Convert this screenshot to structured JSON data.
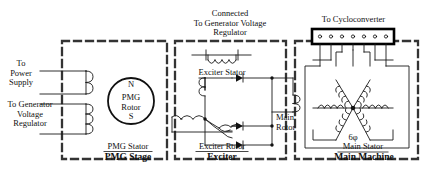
{
  "diagram": {
    "stages": [
      {
        "id": "pmg",
        "caption": "PMG Stage",
        "inner_label": "PMG Stator"
      },
      {
        "id": "exciter",
        "caption": "Exciter",
        "inner_label": "Exciter Rotor"
      },
      {
        "id": "main",
        "caption": "Main Machine",
        "inner_label": "Main Stator"
      }
    ],
    "labels": {
      "to_power_supply": "To\nPower\nSupply",
      "to_power_supply_lines": [
        "To",
        "Power",
        "Supply"
      ],
      "to_generator_voltage_regulator_lines": [
        "To Generator",
        "Voltage",
        "Regulator"
      ],
      "connected_to_gvr_lines": [
        "Connected",
        "To Generator Voltage",
        "Regulator"
      ],
      "exciter_stator": "Exciter Stator",
      "exciter_rotor": "Exciter Rotor",
      "pmg_stator": "PMG Stator",
      "pmg_stage": "PMG Stage",
      "exciter": "Exciter",
      "main_rotor_lines": [
        "Main",
        "Rotor"
      ],
      "main_stator": "Main Stator",
      "main_machine": "Main Machine",
      "to_cycloconverter": "To Cycloconverter",
      "phase_count": "6φ",
      "pmg_rotor_north": "N",
      "pmg_rotor_south": "S",
      "pmg_rotor_lines": [
        "PMG",
        "Rotor"
      ]
    },
    "components": {
      "pmg_rotor": {
        "type": "permanent-magnet-rotor",
        "poles": [
          "N",
          "S"
        ]
      },
      "pmg_stator_coils": 2,
      "exciter_stator_coil": 1,
      "exciter_rotor_phases": 3,
      "rectifier_diodes": 3,
      "main_rotor_field_coil": 1,
      "main_stator_phases": 6,
      "terminal_block_terminals": 7
    },
    "colors": {
      "line": "#1a1a1a",
      "dashed_box": "#333333",
      "background": "#ffffff",
      "terminal_block": "#000000"
    }
  }
}
